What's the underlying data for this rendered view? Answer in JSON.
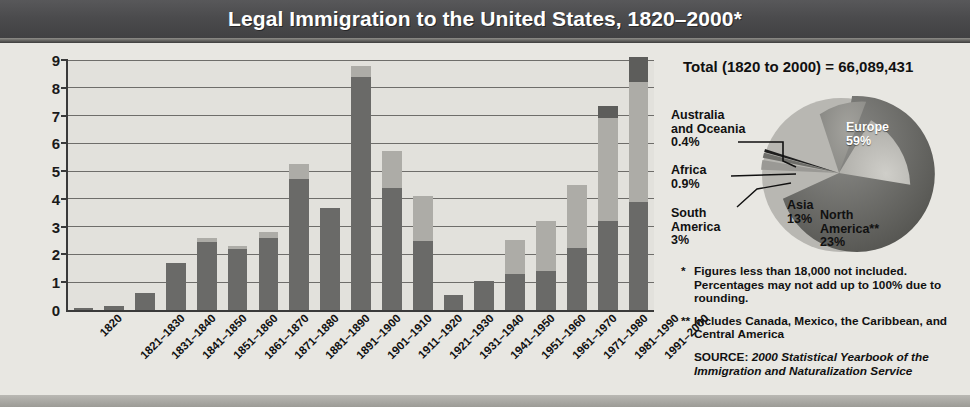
{
  "title": "Legal Immigration to the United States, 1820–2000*",
  "chart_data": {
    "type": "bar",
    "title": "Legal Immigration to the United States, 1820–2000*",
    "xlabel": "",
    "ylabel": "Millions of people",
    "ylim": [
      0,
      9
    ],
    "yticks": [
      "0",
      "1",
      "2",
      "3",
      "4",
      "5",
      "6",
      "7",
      "8",
      "9"
    ],
    "grid": true,
    "stacked": true,
    "categories": [
      "1820",
      "1821–1830",
      "1831–1840",
      "1841–1850",
      "1851–1860",
      "1861–1870",
      "1871–1880",
      "1881–1890",
      "1891–1900",
      "1901–1910",
      "1911–1920",
      "1921–1930",
      "1931–1940",
      "1941–1950",
      "1951–1960",
      "1961–1970",
      "1971–1980",
      "1981–1990",
      "1991–2000"
    ],
    "values": [
      0.08,
      0.14,
      0.6,
      1.71,
      2.6,
      2.31,
      2.81,
      5.25,
      3.69,
      8.8,
      5.74,
      4.11,
      0.53,
      1.03,
      2.52,
      3.21,
      4.49,
      7.34,
      9.1
    ],
    "series": [
      {
        "name": "segment-lower",
        "values": [
          0.08,
          0.14,
          0.6,
          1.71,
          2.45,
          2.21,
          2.6,
          4.7,
          3.69,
          8.4,
          4.4,
          2.5,
          0.53,
          1.03,
          1.3,
          1.4,
          2.25,
          3.2,
          3.9
        ]
      },
      {
        "name": "segment-upper",
        "values": [
          0,
          0,
          0,
          0,
          0.15,
          0.1,
          0.21,
          0.55,
          0,
          0.4,
          1.34,
          1.61,
          0,
          0,
          1.22,
          1.81,
          2.24,
          3.7,
          4.3
        ]
      },
      {
        "name": "segment-cap",
        "values": [
          0,
          0,
          0,
          0,
          0,
          0,
          0,
          0,
          0,
          0,
          0,
          0,
          0,
          0,
          0,
          0,
          0,
          0.44,
          0.9
        ]
      }
    ]
  },
  "pie": {
    "total_label": "Total (1820 to 2000) = 66,089,431",
    "type": "pie",
    "slices": [
      {
        "name": "Europe",
        "label": "Europe",
        "percent_label": "59%",
        "value": 59
      },
      {
        "name": "North America",
        "label": "North\nAmerica**",
        "percent_label": "23%",
        "value": 23
      },
      {
        "name": "Asia",
        "label": "Asia",
        "percent_label": "13%",
        "value": 13
      },
      {
        "name": "South America",
        "label": "South\nAmerica",
        "percent_label": "3%",
        "value": 3
      },
      {
        "name": "Africa",
        "label": "Africa",
        "percent_label": "0.9%",
        "value": 0.9
      },
      {
        "name": "Australia and Oceania",
        "label": "Australia\nand Oceania",
        "percent_label": "0.4%",
        "value": 0.4
      }
    ],
    "labels": {
      "australia_l1": "Australia",
      "australia_l2": "and Oceania",
      "australia_pct": "0.4%",
      "africa_l1": "Africa",
      "africa_pct": "0.9%",
      "south_l1": "South",
      "south_l2": "America",
      "south_pct": "3%",
      "europe_l1": "Europe",
      "europe_pct": "59%",
      "asia_l1": "Asia",
      "asia_pct": "13%",
      "north_l1": "North",
      "north_l2": "America**",
      "north_pct": "23%"
    }
  },
  "notes": {
    "mark1": "*",
    "note1_line1": "Figures less than 18,000 not included. Percentages",
    "note1_line2": "may not add up to 100% due to rounding.",
    "mark2": "**",
    "note2_line1": "Includes Canada, Mexico, the Caribbean, and",
    "note2_line2": "Central America",
    "source_prefix": "SOURCE: ",
    "source_line1": "2000 Statistical Yearbook of the",
    "source_line2": "Immigration and Naturalization Service"
  },
  "colors": {
    "banner": "#4a4a4c",
    "panel": "#e8e7e2",
    "bar_dark": "#6a6a68",
    "bar_light": "#adaca7",
    "bar_cap": "#5d5d5b",
    "axis": "#3a3a3a"
  }
}
